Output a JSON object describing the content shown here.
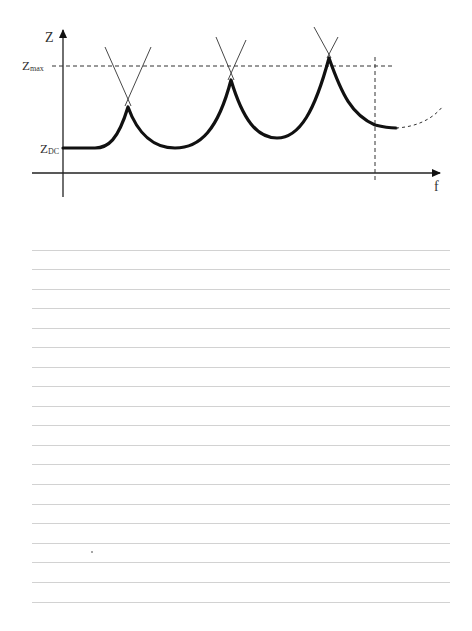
{
  "diagram": {
    "y_axis_label": "Z",
    "x_axis_label": "f",
    "z_max_label": "Z",
    "z_max_sub": "max",
    "z_dc_label": "Z",
    "z_dc_sub": "DC",
    "colors": {
      "curve": "#111111",
      "axis": "#222222",
      "dashed": "#333333",
      "rule": "#d2d2d2"
    },
    "peaks": [
      {
        "index": 1,
        "x": 128,
        "y": 107,
        "exceeds_zmax": false
      },
      {
        "index": 2,
        "x": 231,
        "y": 80,
        "exceeds_zmax": false
      },
      {
        "index": 3,
        "x": 329,
        "y": 58,
        "exceeds_zmax": true
      }
    ],
    "annotations": {
      "zmax_line": "horizontal dashed line at Z_max",
      "cutoff_line": "vertical dashed line at upper frequency limit",
      "extrapolation": "dashed continuation of curve beyond frequency limit"
    }
  },
  "notes": {
    "ruled_line_count": 19,
    "ruled_line_start_y": 250,
    "ruled_line_spacing": 19.55
  }
}
